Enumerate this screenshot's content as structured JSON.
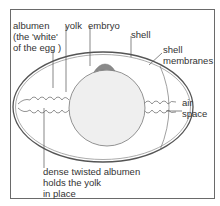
{
  "diagram": {
    "labels": {
      "albumen": [
        "albumen",
        "(the 'white'",
        "of the egg )"
      ],
      "yolk": "yolk",
      "embryo": "embryo",
      "shell": "shell",
      "shell_membranes": [
        "shell",
        "membranes"
      ],
      "air_space": [
        "air",
        "space"
      ],
      "chalaza": [
        "dense twisted albumen",
        "holds the yolk",
        "in place"
      ]
    },
    "colors": {
      "line": "#555555",
      "yolk_fill": "#efefef",
      "embryo_fill": "#8a8a8a",
      "frame": "#6a6a6a"
    }
  }
}
